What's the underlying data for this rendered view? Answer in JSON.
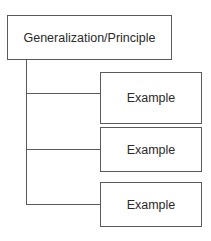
{
  "diagram": {
    "type": "hierarchy",
    "root": {
      "label": "Generalization/Principle"
    },
    "children": [
      {
        "label": "Example"
      },
      {
        "label": "Example"
      },
      {
        "label": "Example"
      }
    ],
    "colors": {
      "stroke": "#5a5a5a",
      "text": "#2a2a2a",
      "background": "#ffffff"
    }
  }
}
